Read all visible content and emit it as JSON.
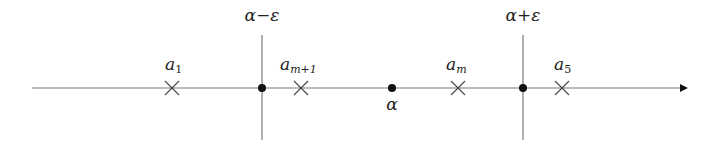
{
  "diagram": {
    "axis": {
      "x_start": 32,
      "x_end": 680,
      "y": 88,
      "color": "#7a7a7a",
      "arrow": "right"
    },
    "colors": {
      "line": "#7a7a7a",
      "point": "#111111",
      "cross": "#444444",
      "text": "#222222"
    },
    "vertical_lines": [
      {
        "x": 262,
        "label_base": "α",
        "label_op": "−",
        "label_var": "ε",
        "label": "α−ε"
      },
      {
        "x": 523,
        "label_base": "α",
        "label_op": "+",
        "label_var": "ε",
        "label": "α+ε"
      }
    ],
    "points": [
      {
        "x": 262,
        "label": ""
      },
      {
        "x": 392,
        "label": "α"
      },
      {
        "x": 523,
        "label": ""
      }
    ],
    "crosses": [
      {
        "x": 172,
        "base": "a",
        "sub": "1",
        "label": "a1"
      },
      {
        "x": 301,
        "base": "a",
        "sub": "m+1",
        "label": "am+1"
      },
      {
        "x": 458,
        "base": "a",
        "sub": "m",
        "label": "am"
      },
      {
        "x": 562,
        "base": "a",
        "sub": "5",
        "label": "a5"
      }
    ]
  }
}
